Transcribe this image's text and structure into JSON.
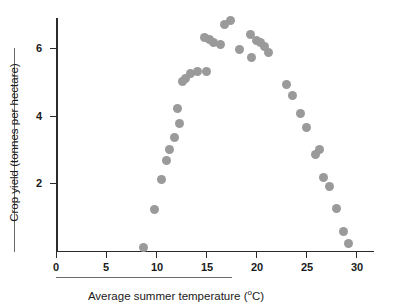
{
  "chart_data": {
    "type": "scatter",
    "title": "",
    "xlabel": "Average summer temperature (ºC)",
    "ylabel": "Crop yield (tonnes per hectare)",
    "xlim": [
      0,
      33
    ],
    "ylim": [
      0,
      7.2
    ],
    "xticks": [
      0,
      5,
      10,
      15,
      20,
      25,
      30
    ],
    "xtick_labels": [
      "0",
      "5",
      "10",
      "15",
      "20",
      "25",
      "30"
    ],
    "yticks": [
      2,
      4,
      6
    ],
    "ytick_labels": [
      "2",
      "4",
      "6"
    ],
    "grid": false,
    "legend": false,
    "marker_color": "#9a9a9a",
    "axis_color": "#2b2b2b",
    "points": [
      {
        "x": 8.7,
        "y": 0.1
      },
      {
        "x": 9.8,
        "y": 1.2
      },
      {
        "x": 10.5,
        "y": 2.1
      },
      {
        "x": 11.0,
        "y": 2.65
      },
      {
        "x": 11.3,
        "y": 3.0
      },
      {
        "x": 11.8,
        "y": 3.35
      },
      {
        "x": 12.1,
        "y": 4.2
      },
      {
        "x": 12.3,
        "y": 3.75
      },
      {
        "x": 12.6,
        "y": 5.0
      },
      {
        "x": 12.9,
        "y": 5.1
      },
      {
        "x": 13.4,
        "y": 5.25
      },
      {
        "x": 14.1,
        "y": 5.3
      },
      {
        "x": 15.0,
        "y": 5.3
      },
      {
        "x": 14.8,
        "y": 6.3
      },
      {
        "x": 15.3,
        "y": 6.25
      },
      {
        "x": 15.7,
        "y": 6.15
      },
      {
        "x": 16.4,
        "y": 6.1
      },
      {
        "x": 16.8,
        "y": 6.7
      },
      {
        "x": 17.4,
        "y": 6.8
      },
      {
        "x": 18.3,
        "y": 5.95
      },
      {
        "x": 19.4,
        "y": 6.4
      },
      {
        "x": 19.5,
        "y": 5.7
      },
      {
        "x": 20.0,
        "y": 6.2
      },
      {
        "x": 20.4,
        "y": 6.15
      },
      {
        "x": 20.8,
        "y": 6.05
      },
      {
        "x": 21.2,
        "y": 5.85
      },
      {
        "x": 23.0,
        "y": 4.9
      },
      {
        "x": 23.6,
        "y": 4.6
      },
      {
        "x": 24.4,
        "y": 4.05
      },
      {
        "x": 25.0,
        "y": 3.65
      },
      {
        "x": 25.9,
        "y": 2.85
      },
      {
        "x": 26.3,
        "y": 3.0
      },
      {
        "x": 26.7,
        "y": 2.15
      },
      {
        "x": 27.3,
        "y": 1.9
      },
      {
        "x": 28.0,
        "y": 1.25
      },
      {
        "x": 28.7,
        "y": 0.55
      },
      {
        "x": 29.2,
        "y": 0.2
      }
    ]
  }
}
